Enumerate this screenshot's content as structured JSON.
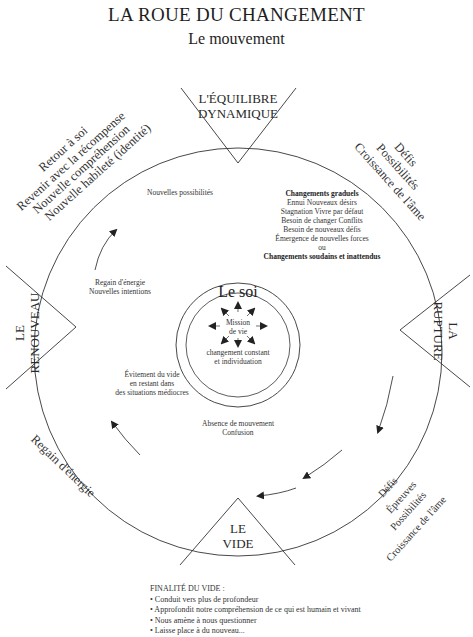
{
  "header": {
    "title": "LA ROUE DU CHANGEMENT",
    "subtitle": "Le mouvement"
  },
  "quadrants": {
    "top": {
      "line1": "L'ÉQUILIBRE",
      "line2": "DYNAMIQUE"
    },
    "right": {
      "line1": "LA",
      "line2": "RUPTURE"
    },
    "bottom": {
      "line1": "LE",
      "line2": "VIDE"
    },
    "left": {
      "line1": "LE",
      "line2": "RENOUVEAU"
    }
  },
  "outer_labels": {
    "top_left": [
      "Retour à soi",
      "Revenir avec la récompense",
      "Nouvelle compréhension",
      "Nouvelle habileté (identité)"
    ],
    "top_right": [
      "Défis",
      "Possibilités",
      "Croissance de l'âme"
    ],
    "bottom_right": [
      "Défis",
      "Épreuves",
      "Possibilités",
      "Croissance de l'âme"
    ],
    "bottom_left": [
      "Regain d'énergie"
    ]
  },
  "inner_labels": {
    "new_possibilities": "Nouvelles possibilités",
    "gradual_changes": {
      "heading": "Changements graduels",
      "lines": [
        "Ennui   Nouveaux désirs",
        "Stagnation   Vivre par défaut",
        "Besoin de changer   Conflits",
        "Besoin de nouveaux défis",
        "Émergence de nouvelles forces",
        "ou"
      ],
      "footer": "Changements soudains et inattendus"
    },
    "renewal": [
      "Regain d'énergie",
      "Nouvelles intentions"
    ],
    "avoidance": [
      "Évitement du vide",
      "en restant dans",
      "des situations médiocres"
    ],
    "void": [
      "Absence de mouvement",
      "Confusion"
    ]
  },
  "center": {
    "title": "Le soi",
    "mission": [
      "Mission",
      "de vie"
    ],
    "caption": [
      "changement constant",
      "et individuation"
    ]
  },
  "footer": {
    "heading": "FINALITÉ DU VIDE :",
    "bullets": [
      "Conduit vers plus de profondeur",
      "Approfondit notre compréhension de ce qui est humain et vivant",
      "Nous amène à nous questionner",
      "Laisse place à du nouveau..."
    ]
  },
  "colors": {
    "ink": "#2a2a2a",
    "background": "#ffffff"
  }
}
